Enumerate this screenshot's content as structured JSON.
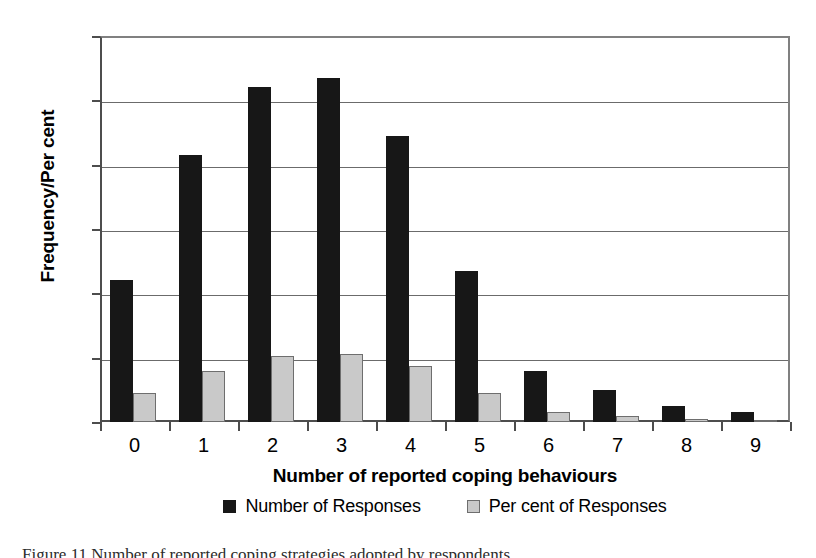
{
  "chart_data": {
    "type": "bar",
    "title": "",
    "xlabel": "Number of reported coping behaviours",
    "ylabel": "Frequency/Per cent",
    "categories": [
      "0",
      "1",
      "2",
      "3",
      "4",
      "5",
      "6",
      "7",
      "8",
      "9"
    ],
    "series": [
      {
        "name": "Number of Responses",
        "color": "#171717",
        "values": [
          44,
          83,
          104,
          107,
          89,
          47,
          16,
          10,
          5,
          3
        ]
      },
      {
        "name": "Per cent of Responses",
        "color": "#c9c9c9",
        "values": [
          9,
          16,
          20.5,
          21,
          17.5,
          9,
          3,
          2,
          1,
          0.5
        ]
      }
    ],
    "ylim": [
      0,
      120
    ],
    "yticks": [
      0,
      20,
      40,
      60,
      80,
      100,
      120
    ],
    "ytick_labels": [
      "0",
      "20",
      "40",
      "60",
      "80",
      "100",
      "120"
    ],
    "grid": "horizontal",
    "legend_position": "bottom"
  },
  "axes": {
    "y_title": "Frequency/Per cent",
    "x_title": "Number of reported coping behaviours"
  },
  "legend": {
    "entries": [
      {
        "label": "Number of Responses",
        "swatch": "dark-square-icon"
      },
      {
        "label": "Per cent of Responses",
        "swatch": "light-square-icon"
      }
    ]
  },
  "caption": {
    "text": "Figure 11 Number of reported coping strategies adopted by respondents"
  }
}
